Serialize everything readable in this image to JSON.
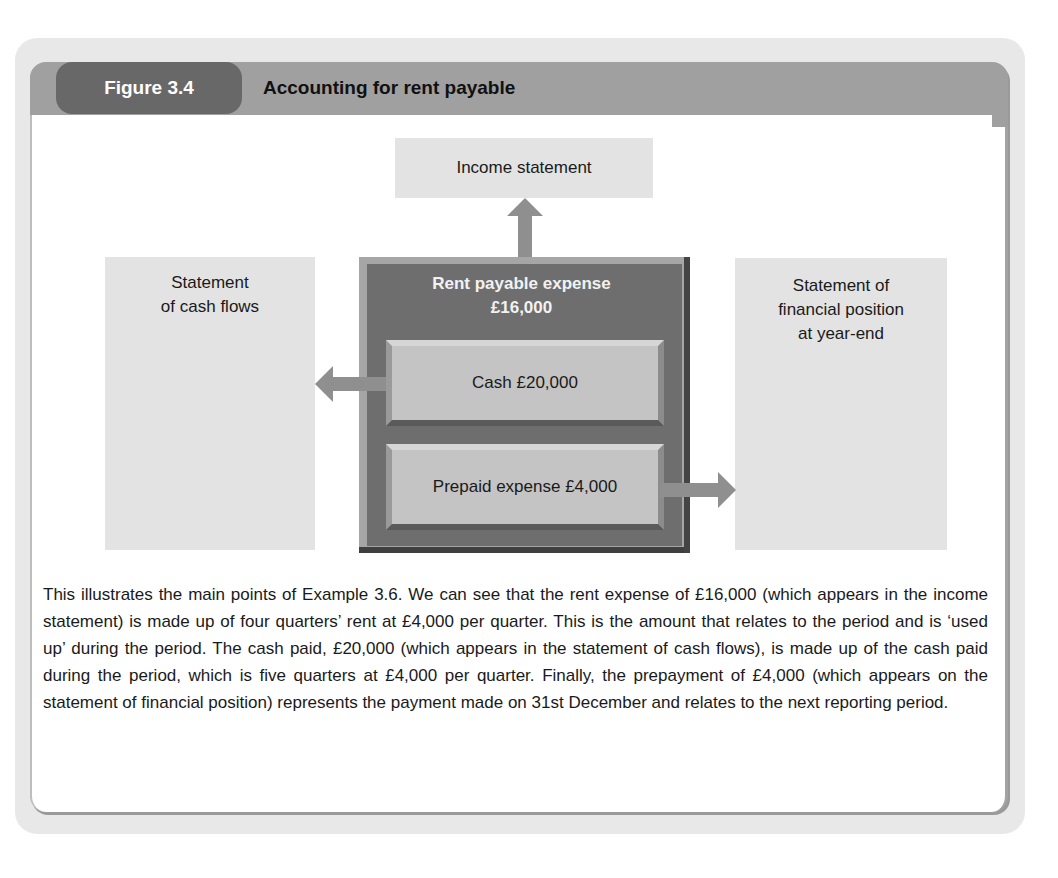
{
  "figure": {
    "label": "Figure 3.4",
    "title": "Accounting for rent payable"
  },
  "diagram": {
    "income_statement": "Income statement",
    "cash_flows": "Statement of cash flows",
    "cash_flows_lines": [
      "Statement",
      "of cash flows"
    ],
    "financial_position": "Statement of financial position at year-end",
    "financial_position_lines": [
      "Statement of",
      "financial position",
      "at year-end"
    ],
    "central": {
      "title": "Rent payable expense",
      "amount": "£16,000",
      "cash": "Cash £20,000",
      "prepaid": "Prepaid expense £4,000"
    },
    "flows": [
      {
        "from": "Rent payable expense £16,000",
        "to": "Income statement",
        "direction": "up"
      },
      {
        "from": "Cash £20,000",
        "to": "Statement of cash flows",
        "direction": "left"
      },
      {
        "from": "Prepaid expense £4,000",
        "to": "Statement of financial position at year-end",
        "direction": "right"
      }
    ]
  },
  "caption": "This illustrates the main points of Example 3.6. We can see that the rent expense of £16,000 (which appears in the income statement) is made up of four quarters’ rent at £4,000 per quarter. This is the amount that relates to the period and is ‘used up’ during the period. The cash paid, £20,000 (which appears in the statement of cash flows), is made up of the cash paid during the period, which is five quarters at £4,000 per quarter. Finally, the prepayment of £4,000 (which appears on the statement of financial position) represents the payment made on 31st December and relates to the next reporting period.",
  "colors": {
    "tab_dark": "#686868",
    "header_bar": "#a0a0a0",
    "panel_bg": "#e8e8e8",
    "box_light": "#e3e3e3",
    "central_box": "#6e6e6e",
    "sub_box": "#c4c4c4",
    "arrow": "#8f8f8f"
  }
}
